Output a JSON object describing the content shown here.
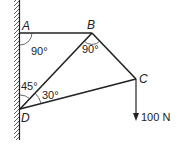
{
  "diagram": {
    "points": {
      "A": {
        "label": "A",
        "x": 20,
        "y": 33
      },
      "B": {
        "label": "B",
        "x": 92,
        "y": 33
      },
      "C": {
        "label": "C",
        "x": 136,
        "y": 79
      },
      "D": {
        "label": "D",
        "x": 20,
        "y": 109
      }
    },
    "angles": {
      "at_A": "90°",
      "at_B": "90°",
      "at_D_wall": "45°",
      "at_D_members": "30°"
    },
    "load": {
      "label": "100 N",
      "direction": "down",
      "applied_at": "C"
    },
    "members": [
      "AB",
      "BC",
      "BD",
      "CD"
    ],
    "support": "fixed-wall"
  }
}
